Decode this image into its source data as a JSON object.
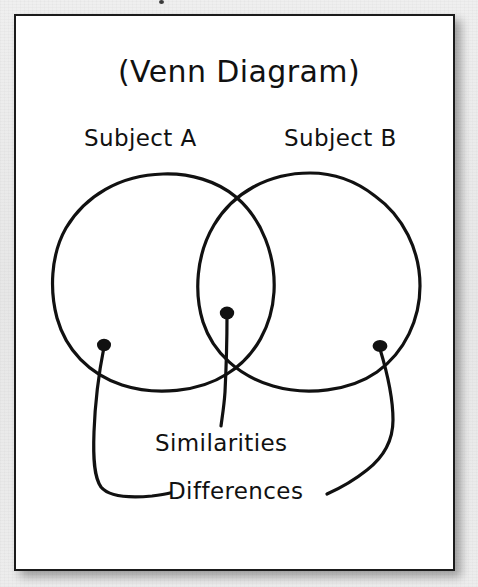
{
  "document": {
    "title": "(Venn Diagram)",
    "background_color": "#ececec",
    "paper_color": "#ffffff",
    "ink_color": "#111111",
    "border_color": "#1b1b1b"
  },
  "diagram": {
    "type": "venn",
    "style": "hand-drawn",
    "title": "(Venn Diagram)",
    "sets": [
      {
        "id": "set-a",
        "label": "Subject A",
        "side": "left"
      },
      {
        "id": "set-b",
        "label": "Subject B",
        "side": "right"
      }
    ],
    "region_labels": [
      {
        "id": "similarities",
        "label": "Similarities",
        "region": "intersection"
      },
      {
        "id": "differences",
        "label": "Differences",
        "region": "exclusive-left-and-right"
      }
    ],
    "callouts": [
      {
        "id": "callout-left",
        "dot": "left-circle-only",
        "target": "Differences"
      },
      {
        "id": "callout-center",
        "dot": "intersection",
        "target": "Similarities"
      },
      {
        "id": "callout-right",
        "dot": "right-circle-only",
        "target": "Differences"
      }
    ]
  },
  "icons": {
    "dot": "filled-dot-marker",
    "leader": "leader-line"
  }
}
